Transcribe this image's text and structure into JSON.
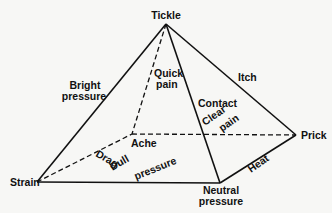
{
  "diagram": {
    "type": "pyramid",
    "vertices": {
      "tickle": {
        "label": "Tickle",
        "x": 166,
        "y": 24
      },
      "strain": {
        "label": "Strain",
        "x": 37,
        "y": 182
      },
      "ache": {
        "label": "Ache",
        "x": 132,
        "y": 134
      },
      "prick": {
        "label": "Prick",
        "x": 296,
        "y": 135
      },
      "neutral": {
        "label_line1": "Neutral",
        "label_line2": "pressure",
        "x": 220,
        "y": 183
      }
    },
    "edges": [
      {
        "from": "tickle",
        "to": "strain",
        "style": "solid",
        "label_line1": "Bright",
        "label_line2": "pressure"
      },
      {
        "from": "tickle",
        "to": "ache",
        "style": "dashed",
        "label_line1": "Quick",
        "label_line2": "pain"
      },
      {
        "from": "tickle",
        "to": "neutral",
        "style": "solid",
        "label": "Contact"
      },
      {
        "from": "tickle",
        "to": "prick",
        "style": "solid",
        "label": "Itch"
      },
      {
        "from": "strain",
        "to": "ache",
        "style": "dashed",
        "label": "Drag"
      },
      {
        "from": "ache",
        "to": "prick",
        "style": "dashed",
        "label_line1": "Clear",
        "label_line2": "pain"
      },
      {
        "from": "strain",
        "to": "neutral",
        "style": "solid",
        "label_line1": "Dull",
        "label_line2": "pressure"
      },
      {
        "from": "neutral",
        "to": "prick",
        "style": "solid",
        "label": "Heat"
      }
    ]
  },
  "labels": {
    "tickle": "Tickle",
    "strain": "Strain",
    "ache": "Ache",
    "prick": "Prick",
    "neutral_1": "Neutral",
    "neutral_2": "pressure",
    "bright_1": "Bright",
    "bright_2": "pressure",
    "quick_1": "Quick",
    "quick_2": "pain",
    "itch": "Itch",
    "contact": "Contact",
    "clear": "Clear",
    "pain": "pain",
    "drag": "Drag",
    "dull": "Dull",
    "dull_pressure": "pressure",
    "heat": "Heat"
  }
}
